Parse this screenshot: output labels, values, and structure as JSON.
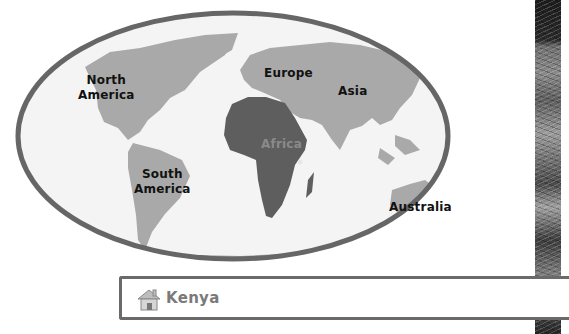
{
  "map": {
    "continents": [
      {
        "id": "north-america",
        "label": "North\nAmerica",
        "lines": [
          "North",
          "America"
        ]
      },
      {
        "id": "south-america",
        "label": "South\nAmerica",
        "lines": [
          "South",
          "America"
        ]
      },
      {
        "id": "europe",
        "label": "Europe",
        "lines": [
          "Europe"
        ]
      },
      {
        "id": "asia",
        "label": "Asia",
        "lines": [
          "Asia"
        ]
      },
      {
        "id": "africa",
        "label": "Africa",
        "lines": [
          "Africa"
        ],
        "highlighted": true
      },
      {
        "id": "australia",
        "label": "Australia",
        "lines": [
          "Australia"
        ]
      }
    ],
    "colors": {
      "outline": "#666666",
      "ocean": "#f4f4f4",
      "land": "#a9a9a9",
      "highlight": "#5e5e5e",
      "marker": "#e6e6e6"
    }
  },
  "banner": {
    "icon": "house-icon",
    "title": "Kenya"
  }
}
